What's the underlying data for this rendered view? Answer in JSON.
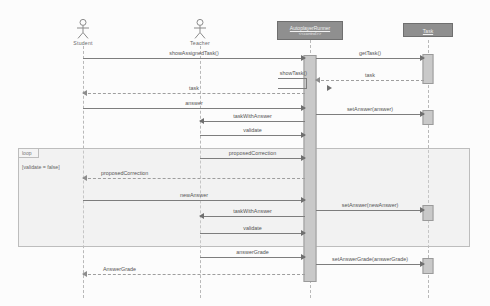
{
  "diagram": {
    "type": "uml-sequence-diagram",
    "width": 490,
    "height": 306,
    "background_color": "#fcfcfc",
    "line_color": "#7d7d7d",
    "box_fill_color": "#8f8f8f",
    "activation_fill_color": "#c9c9c9",
    "fragment_fill_color": "#dedede"
  },
  "participants": [
    {
      "id": "student",
      "label": "Student",
      "kind": "actor",
      "x": 83
    },
    {
      "id": "teacher",
      "label": "Teacher",
      "kind": "actor",
      "x": 200
    },
    {
      "id": "runner",
      "label": "AutoplayerRunner",
      "stereotype": "<<control>>",
      "kind": "object",
      "x": 310
    },
    {
      "id": "task",
      "label": "Task",
      "kind": "object",
      "x": 428
    }
  ],
  "messages": [
    {
      "seq": 1,
      "label": "showAssignedTask()",
      "from": "student",
      "to": "runner",
      "kind": "call",
      "y": 58
    },
    {
      "seq": 2,
      "label": "getTask()",
      "from": "runner",
      "to": "task",
      "kind": "call",
      "y": 58
    },
    {
      "seq": 3,
      "label": "showTask()",
      "from": "runner",
      "to": "runner",
      "kind": "self",
      "y": 83
    },
    {
      "seq": 4,
      "label": "task",
      "from": "task",
      "to": "runner",
      "kind": "return",
      "y": 80
    },
    {
      "seq": 5,
      "label": "task",
      "from": "runner",
      "to": "student",
      "kind": "return",
      "y": 93
    },
    {
      "seq": 6,
      "label": "answer",
      "from": "student",
      "to": "runner",
      "kind": "call",
      "y": 108
    },
    {
      "seq": 7,
      "label": "setAnswer(answer)",
      "from": "runner",
      "to": "task",
      "kind": "call",
      "y": 114
    },
    {
      "seq": 8,
      "label": "taskWithAnswer",
      "from": "runner",
      "to": "teacher",
      "kind": "call",
      "y": 121
    },
    {
      "seq": 9,
      "label": "validate",
      "from": "teacher",
      "to": "runner",
      "kind": "call",
      "y": 135
    },
    {
      "seq": 10,
      "label": "proposedCorrection",
      "from": "teacher",
      "to": "runner",
      "kind": "call",
      "y": 158
    },
    {
      "seq": 11,
      "label": "proposedCorrection",
      "from": "runner",
      "to": "student",
      "kind": "return",
      "y": 178
    },
    {
      "seq": 12,
      "label": "newAnswer",
      "from": "student",
      "to": "runner",
      "kind": "call",
      "y": 200
    },
    {
      "seq": 13,
      "label": "setAnswer(newAnswer)",
      "from": "runner",
      "to": "task",
      "kind": "call",
      "y": 210
    },
    {
      "seq": 14,
      "label": "taskWithAnswer",
      "from": "runner",
      "to": "teacher",
      "kind": "call",
      "y": 216
    },
    {
      "seq": 15,
      "label": "validate",
      "from": "teacher",
      "to": "runner",
      "kind": "call",
      "y": 233
    },
    {
      "seq": 16,
      "label": "answerGrade",
      "from": "teacher",
      "to": "runner",
      "kind": "call",
      "y": 257
    },
    {
      "seq": 17,
      "label": "setAnswerGrade(answerGrade)",
      "from": "runner",
      "to": "task",
      "kind": "call",
      "y": 264
    },
    {
      "seq": 18,
      "label": "AnswerGrade",
      "from": "runner",
      "to": "student",
      "kind": "return",
      "y": 274
    }
  ],
  "fragment": {
    "operator": "loop",
    "guard": "[validate = false]",
    "top": 148,
    "bottom": 245
  },
  "activations": [
    {
      "participant": "runner",
      "top": 55,
      "height": 225
    },
    {
      "participant": "task",
      "top": 54,
      "height": 28
    },
    {
      "participant": "task",
      "top": 110,
      "height": 13
    },
    {
      "participant": "task",
      "top": 205,
      "height": 14
    },
    {
      "participant": "task",
      "top": 258,
      "height": 14
    }
  ]
}
